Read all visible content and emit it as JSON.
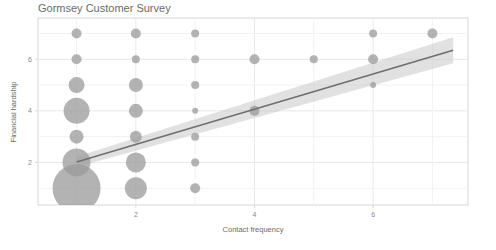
{
  "chart_data": {
    "type": "scatter",
    "title": "Gormsey Customer Survey",
    "xlabel": "Contact frequency",
    "ylabel": "Financial hardship",
    "xlim": [
      0.35,
      7.6
    ],
    "ylim": [
      0.35,
      7.6
    ],
    "xticks": [
      2,
      4,
      6
    ],
    "yticks": [
      2,
      4,
      6
    ],
    "xtick_labels": [
      "2",
      "4",
      "6"
    ],
    "ytick_labels": [
      "2",
      "4",
      "6"
    ],
    "grid": true,
    "legend": "none",
    "point_color": "#9a9a9a",
    "point_opacity": 0.75,
    "line_color": "#6f6f6f",
    "band_color": "#c9c9c9",
    "band_opacity": 0.55,
    "axis_color": "#d6d6d6",
    "grid_color": "#e8e8e8",
    "series": [
      {
        "name": "respondents",
        "encoding": "bubble-size-by-count",
        "points": [
          {
            "x": 1,
            "y": 7,
            "size": 5
          },
          {
            "x": 1,
            "y": 6,
            "size": 5
          },
          {
            "x": 1,
            "y": 5,
            "size": 8
          },
          {
            "x": 1,
            "y": 4,
            "size": 13
          },
          {
            "x": 1,
            "y": 3,
            "size": 7
          },
          {
            "x": 1,
            "y": 2,
            "size": 14
          },
          {
            "x": 1,
            "y": 1,
            "size": 24
          },
          {
            "x": 2,
            "y": 7,
            "size": 5
          },
          {
            "x": 2,
            "y": 6,
            "size": 4
          },
          {
            "x": 2,
            "y": 5,
            "size": 7
          },
          {
            "x": 2,
            "y": 4,
            "size": 7
          },
          {
            "x": 2,
            "y": 3,
            "size": 6
          },
          {
            "x": 2,
            "y": 2,
            "size": 10
          },
          {
            "x": 2,
            "y": 1,
            "size": 11
          },
          {
            "x": 3,
            "y": 7,
            "size": 4
          },
          {
            "x": 3,
            "y": 6,
            "size": 4
          },
          {
            "x": 3,
            "y": 5,
            "size": 4
          },
          {
            "x": 3,
            "y": 4,
            "size": 3
          },
          {
            "x": 3,
            "y": 3,
            "size": 4
          },
          {
            "x": 3,
            "y": 2,
            "size": 4
          },
          {
            "x": 3,
            "y": 1,
            "size": 5
          },
          {
            "x": 4,
            "y": 6,
            "size": 5
          },
          {
            "x": 4,
            "y": 4,
            "size": 5
          },
          {
            "x": 5,
            "y": 6,
            "size": 4
          },
          {
            "x": 6,
            "y": 7,
            "size": 4
          },
          {
            "x": 6,
            "y": 6,
            "size": 5
          },
          {
            "x": 6,
            "y": 5,
            "size": 3
          },
          {
            "x": 7,
            "y": 7,
            "size": 5
          }
        ]
      }
    ],
    "trend": {
      "type": "linear-fit",
      "x_start": 1.0,
      "x_end": 7.35,
      "y_start": 2.02,
      "y_end": 6.35,
      "band_lower_start": 1.82,
      "band_lower_end": 5.85,
      "band_upper_start": 2.22,
      "band_upper_end": 6.85
    }
  }
}
